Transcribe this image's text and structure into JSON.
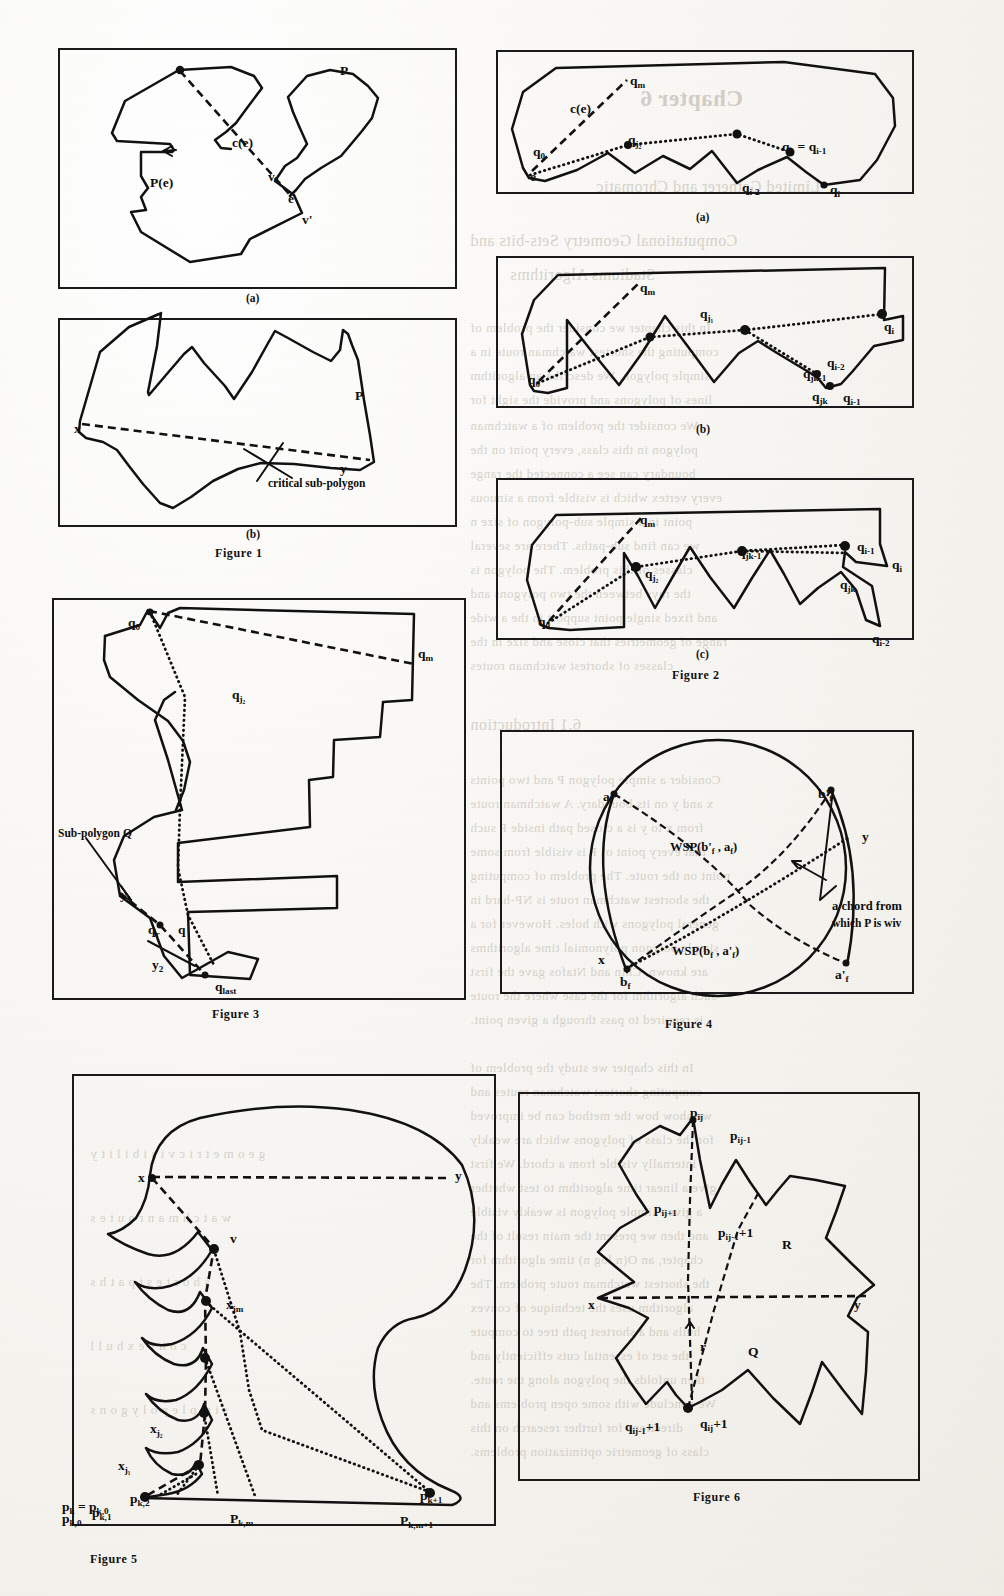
{
  "page": {
    "width": 1004,
    "height": 1596,
    "background_color": "#f3f1ec",
    "ink_color": "#111111",
    "ghost_color": "#b9b3a8"
  },
  "ghost_text": [
    {
      "text": "Chapter 6",
      "x": 640,
      "y": 86,
      "size": "big"
    },
    {
      "text": "Limited Gatherer and Chromatic",
      "x": 596,
      "y": 178,
      "size": "mid"
    },
    {
      "text": "Computational Geometry Sets-bits and",
      "x": 470,
      "y": 232,
      "size": "mid"
    },
    {
      "text": "Stadiums Algorithms",
      "x": 510,
      "y": 266,
      "size": "mid"
    },
    {
      "text": "In this chapter we consider the problem of",
      "x": 470,
      "y": 320,
      "size": "sm"
    },
    {
      "text": "computing the shortest watchman route in a",
      "x": 470,
      "y": 344,
      "size": "sm"
    },
    {
      "text": "simple polygon. We describe an algorithm",
      "x": 470,
      "y": 368,
      "size": "sm"
    },
    {
      "text": "lines of polygons and provide the sight for",
      "x": 470,
      "y": 392,
      "size": "sm"
    },
    {
      "text": "We consider the problem of a watchman",
      "x": 470,
      "y": 418,
      "size": "sm"
    },
    {
      "text": "polygon in this class, every point on the",
      "x": 470,
      "y": 442,
      "size": "sm"
    },
    {
      "text": "boundary can see a connected the range",
      "x": 470,
      "y": 466,
      "size": "sm"
    },
    {
      "text": "every vertex which is visible from a sinuous",
      "x": 470,
      "y": 490,
      "size": "sm"
    },
    {
      "text": "point in a simple sub-polygon of size n",
      "x": 470,
      "y": 514,
      "size": "sm"
    },
    {
      "text": "we can find sub-paths. There are several",
      "x": 470,
      "y": 538,
      "size": "sm"
    },
    {
      "text": "classes of this problem. The polygon is",
      "x": 470,
      "y": 562,
      "size": "sm"
    },
    {
      "text": "the rays between the two polygons and",
      "x": 470,
      "y": 586,
      "size": "sm"
    },
    {
      "text": "and fixed single point support in the a wide",
      "x": 470,
      "y": 610,
      "size": "sm"
    },
    {
      "text": "range of geometries that close and size in the",
      "x": 470,
      "y": 634,
      "size": "sm"
    },
    {
      "text": "classes of shortest watchman routes",
      "x": 470,
      "y": 658,
      "size": "sm"
    },
    {
      "text": "6.1 Introduction",
      "x": 470,
      "y": 716,
      "size": "mid"
    },
    {
      "text": "Consider a simple polygon P and two points",
      "x": 470,
      "y": 772,
      "size": "sm"
    },
    {
      "text": "x and y on its boundary. A watchman route",
      "x": 470,
      "y": 796,
      "size": "sm"
    },
    {
      "text": "from x to y is a closed path inside P such",
      "x": 470,
      "y": 820,
      "size": "sm"
    },
    {
      "text": "that every point of P is visible from some",
      "x": 470,
      "y": 844,
      "size": "sm"
    },
    {
      "text": "point on the route. The problem of computing",
      "x": 470,
      "y": 868,
      "size": "sm"
    },
    {
      "text": "the shortest watchman route is NP-hard in",
      "x": 470,
      "y": 892,
      "size": "sm"
    },
    {
      "text": "general polygons with holes. However for a",
      "x": 470,
      "y": 916,
      "size": "sm"
    },
    {
      "text": "simple polygon polynomial time algorithms",
      "x": 470,
      "y": 940,
      "size": "sm"
    },
    {
      "text": "are known. Chin and Ntafos gave the first",
      "x": 470,
      "y": 964,
      "size": "sm"
    },
    {
      "text": "such algorithm for the case where the route",
      "x": 470,
      "y": 988,
      "size": "sm"
    },
    {
      "text": "is required to pass through a given point.",
      "x": 470,
      "y": 1012,
      "size": "sm"
    },
    {
      "text": "In this chapter we study the problem of",
      "x": 470,
      "y": 1060,
      "size": "sm"
    },
    {
      "text": "computing shortest watchman routes and",
      "x": 470,
      "y": 1084,
      "size": "sm"
    },
    {
      "text": "we show how the method can be improved",
      "x": 470,
      "y": 1108,
      "size": "sm"
    },
    {
      "text": "for the class of polygons which are weakly",
      "x": 470,
      "y": 1132,
      "size": "sm"
    },
    {
      "text": "internally visible from a chord. We first",
      "x": 470,
      "y": 1156,
      "size": "sm"
    },
    {
      "text": "give a linear time algorithm to test whether",
      "x": 470,
      "y": 1180,
      "size": "sm"
    },
    {
      "text": "a given simple polygon is weakly visible",
      "x": 470,
      "y": 1204,
      "size": "sm"
    },
    {
      "text": "and then we present the main result of the",
      "x": 470,
      "y": 1228,
      "size": "sm"
    },
    {
      "text": "chapter, an O(n log n) time algorithm for",
      "x": 470,
      "y": 1252,
      "size": "sm"
    },
    {
      "text": "the shortest watchman route problem. The",
      "x": 470,
      "y": 1276,
      "size": "sm"
    },
    {
      "text": "algorithm uses the technique of convex",
      "x": 470,
      "y": 1300,
      "size": "sm"
    },
    {
      "text": "hulls and a shortest path tree to compute",
      "x": 470,
      "y": 1324,
      "size": "sm"
    },
    {
      "text": "the set of essential cuts efficiently and",
      "x": 470,
      "y": 1348,
      "size": "sm"
    },
    {
      "text": "then unfolds the polygon along the route.",
      "x": 470,
      "y": 1372,
      "size": "sm"
    },
    {
      "text": "We conclude with some open problems and",
      "x": 470,
      "y": 1396,
      "size": "sm"
    },
    {
      "text": "directions for further research on this",
      "x": 470,
      "y": 1420,
      "size": "sm"
    },
    {
      "text": "class of geometric optimization problems.",
      "x": 470,
      "y": 1444,
      "size": "sm"
    },
    {
      "text": "g e o m e t r i c   v i s i b i l i t y",
      "x": 90,
      "y": 1146,
      "size": "sm"
    },
    {
      "text": "w a t c h m a n   r o u t e s",
      "x": 90,
      "y": 1210,
      "size": "sm"
    },
    {
      "text": "s h o r t e s t   p a t h s",
      "x": 90,
      "y": 1274,
      "size": "sm"
    },
    {
      "text": "c o n v e x   h u l l",
      "x": 90,
      "y": 1338,
      "size": "sm"
    },
    {
      "text": "s i m p l e   p o l y g o n s",
      "x": 90,
      "y": 1402,
      "size": "sm"
    }
  ],
  "figures": [
    {
      "id": "figure-1",
      "caption": "Figure  1",
      "panels": [
        {
          "id": "figure-1a",
          "sublabel": "(a)",
          "labels": [
            {
              "name": "polygon-P",
              "text": "P",
              "x": 340,
              "y": 64
            },
            {
              "name": "chord-c-e",
              "text": "c(e)",
              "x": 232,
              "y": 136
            },
            {
              "name": "pocket-P-e",
              "text": "P(e)",
              "x": 150,
              "y": 176
            },
            {
              "name": "vertex-v",
              "text": "v",
              "x": 268,
              "y": 170
            },
            {
              "name": "edge-e",
              "text": "e",
              "x": 288,
              "y": 192
            },
            {
              "name": "vertex-v-prime",
              "text": "v'",
              "x": 302,
              "y": 213
            }
          ]
        },
        {
          "id": "figure-1b",
          "sublabel": "(b)",
          "labels": [
            {
              "name": "polygon-P",
              "text": "P",
              "x": 355,
              "y": 389
            },
            {
              "name": "point-x",
              "text": "x",
              "x": 74,
              "y": 422
            },
            {
              "name": "point-y",
              "text": "y",
              "x": 340,
              "y": 462
            },
            {
              "name": "critical-sub-polygon",
              "text": "critical sub-polygon",
              "x": 268,
              "y": 478
            }
          ]
        }
      ]
    },
    {
      "id": "figure-2",
      "caption": "Figure 2",
      "panels": [
        {
          "id": "figure-2a",
          "sublabel": "(a)",
          "labels": [
            {
              "name": "vertex-qm",
              "text": "q",
              "sub": "m",
              "x": 630,
              "y": 74
            },
            {
              "name": "chord-c-e",
              "text": "c(e)",
              "x": 570,
              "y": 102
            },
            {
              "name": "vertex-q0",
              "text": "q",
              "sub": "0",
              "x": 533,
              "y": 145
            },
            {
              "name": "edge-e",
              "text": "e",
              "x": 530,
              "y": 170
            },
            {
              "name": "vertex-qj2",
              "text": "q",
              "sub": "j₂",
              "x": 628,
              "y": 133
            },
            {
              "name": "vertex-qji-eq-qi-1",
              "text": "q",
              "sub": "jᵢ",
              "x": 782,
              "y": 140,
              "extra": "= q",
              "extra_sub": "i-1"
            },
            {
              "name": "vertex-qi-2",
              "text": "q",
              "sub": "i-2",
              "x": 742,
              "y": 181
            },
            {
              "name": "vertex-qi",
              "text": "q",
              "sub": "i",
              "x": 830,
              "y": 183
            }
          ]
        },
        {
          "id": "figure-2b",
          "sublabel": "(b)",
          "labels": [
            {
              "name": "vertex-qm",
              "text": "q",
              "sub": "m",
              "x": 640,
              "y": 281
            },
            {
              "name": "vertex-qj1",
              "text": "q",
              "sub": "j₁",
              "x": 700,
              "y": 307
            },
            {
              "name": "vertex-q0",
              "text": "q",
              "sub": "0",
              "x": 528,
              "y": 373
            },
            {
              "name": "vertex-qi",
              "text": "q",
              "sub": "i",
              "x": 884,
              "y": 320
            },
            {
              "name": "vertex-qi-2",
              "text": "q",
              "sub": "i-2",
              "x": 827,
              "y": 356
            },
            {
              "name": "vertex-qjk-1",
              "text": "q",
              "sub": "jk-1",
              "x": 803,
              "y": 367
            },
            {
              "name": "vertex-qjk",
              "text": "q",
              "sub": "jk",
              "x": 812,
              "y": 390
            },
            {
              "name": "vertex-qi-1",
              "text": "q",
              "sub": "i-1",
              "x": 843,
              "y": 391
            }
          ]
        },
        {
          "id": "figure-2c",
          "sublabel": "(c)",
          "labels": [
            {
              "name": "vertex-qm",
              "text": "q",
              "sub": "m",
              "x": 640,
              "y": 513
            },
            {
              "name": "vertex-qjk-1",
              "text": "q",
              "sub": "jk-1",
              "x": 738,
              "y": 545
            },
            {
              "name": "vertex-qj2",
              "text": "q",
              "sub": "j₂",
              "x": 645,
              "y": 567
            },
            {
              "name": "vertex-q0",
              "text": "q",
              "sub": "0",
              "x": 538,
              "y": 615
            },
            {
              "name": "vertex-qi-1",
              "text": "q",
              "sub": "i-1",
              "x": 857,
              "y": 540
            },
            {
              "name": "vertex-qjk",
              "text": "q",
              "sub": "jk",
              "x": 840,
              "y": 578
            },
            {
              "name": "vertex-qi",
              "text": "q",
              "sub": "i",
              "x": 892,
              "y": 558
            },
            {
              "name": "vertex-qi-2",
              "text": "q",
              "sub": "i-2",
              "x": 872,
              "y": 632
            }
          ]
        }
      ]
    },
    {
      "id": "figure-3",
      "caption": "Figure 3",
      "labels": [
        {
          "name": "vertex-q0",
          "text": "q",
          "sub": "0",
          "x": 128,
          "y": 616
        },
        {
          "name": "vertex-qm",
          "text": "q",
          "sub": "m",
          "x": 418,
          "y": 647
        },
        {
          "name": "vertex-qj2",
          "text": "q",
          "sub": "j₂",
          "x": 232,
          "y": 688
        },
        {
          "name": "sub-polygon-Q",
          "text": "Sub-polygon Q",
          "x": 58,
          "y": 828
        },
        {
          "name": "point-y1",
          "text": "y",
          "sub": "1",
          "x": 120,
          "y": 888
        },
        {
          "name": "vertex-qr",
          "text": "q",
          "sub": "r",
          "x": 148,
          "y": 923
        },
        {
          "name": "vertex-q",
          "text": "q",
          "x": 178,
          "y": 923
        },
        {
          "name": "point-y2",
          "text": "y",
          "sub": "2",
          "x": 152,
          "y": 958
        },
        {
          "name": "vertex-qlast",
          "text": "q",
          "sub": "last",
          "x": 215,
          "y": 980
        }
      ]
    },
    {
      "id": "figure-4",
      "caption": "Figure 4",
      "labels": [
        {
          "name": "vertex-af",
          "text": "a",
          "sub": "f",
          "x": 603,
          "y": 790
        },
        {
          "name": "vertex-bf-prime",
          "text": "b'",
          "sub": "f",
          "x": 818,
          "y": 787
        },
        {
          "name": "point-y",
          "text": "y",
          "x": 862,
          "y": 830
        },
        {
          "name": "wsp-upper",
          "text": "WSP(b'",
          "sub": "f",
          "extra": ", a",
          "extra_sub": "f",
          "tail": ")",
          "x": 670,
          "y": 841
        },
        {
          "name": "wsp-lower",
          "text": "WSP(b",
          "sub": "f",
          "extra": ", a'",
          "extra_sub": "f",
          "tail": ")",
          "x": 672,
          "y": 945
        },
        {
          "name": "point-x",
          "text": "x",
          "x": 598,
          "y": 953
        },
        {
          "name": "vertex-bf",
          "text": "b",
          "sub": "f",
          "x": 620,
          "y": 975
        },
        {
          "name": "vertex-af-prime",
          "text": "a'",
          "sub": "f",
          "x": 835,
          "y": 968
        },
        {
          "name": "chord-annotation-line1",
          "text": "a chord from",
          "x": 832,
          "y": 900
        },
        {
          "name": "chord-annotation-line2",
          "text": "which P is wiv",
          "x": 832,
          "y": 918
        }
      ]
    },
    {
      "id": "figure-5",
      "caption": "Figure 5",
      "labels": [
        {
          "name": "point-x",
          "text": "x",
          "x": 138,
          "y": 1171
        },
        {
          "name": "point-y",
          "text": "y",
          "x": 455,
          "y": 1169
        },
        {
          "name": "vertex-v",
          "text": "v",
          "x": 230,
          "y": 1232
        },
        {
          "name": "vertex-xjm",
          "text": "x",
          "sub": "jm",
          "x": 226,
          "y": 1298
        },
        {
          "name": "vertex-xj2",
          "text": "x",
          "sub": "j₂",
          "x": 150,
          "y": 1422
        },
        {
          "name": "vertex-xj1",
          "text": "x",
          "sub": "j₁",
          "x": 118,
          "y": 1459
        },
        {
          "name": "vertex-pk-eq",
          "text": "p",
          "sub": "k",
          "extra": "= p",
          "extra_sub": "k,0",
          "x": 62,
          "y": 1500
        },
        {
          "name": "vertex-pk0",
          "text": "p",
          "sub": "k,0",
          "x": 62,
          "y": 1512
        },
        {
          "name": "vertex-pk1",
          "text": "p",
          "sub": "k,1",
          "x": 92,
          "y": 1506
        },
        {
          "name": "vertex-pk2",
          "text": "p",
          "sub": "k,2",
          "x": 130,
          "y": 1492
        },
        {
          "name": "vertex-pkm",
          "text": "P",
          "sub": "k,m",
          "x": 230,
          "y": 1512
        },
        {
          "name": "vertex-pk1plus",
          "text": "p",
          "sub": "k+1",
          "x": 420,
          "y": 1489
        },
        {
          "name": "vertex-pkm1",
          "text": "P",
          "sub": "k,m+1",
          "x": 400,
          "y": 1514
        }
      ]
    },
    {
      "id": "figure-6",
      "caption": "Figure 6",
      "labels": [
        {
          "name": "vertex-pij",
          "text": "p",
          "sub": "i",
          "sub2": "j",
          "x": 690,
          "y": 1106
        },
        {
          "name": "vertex-pij-minus1",
          "text": "p",
          "sub": "i",
          "sub2": "j-1",
          "x": 730,
          "y": 1129
        },
        {
          "name": "vertex-pijplus1",
          "text": "p",
          "sub": "i",
          "sub2": "j+1",
          "x": 654,
          "y": 1202
        },
        {
          "name": "vertex-pij-1plus1",
          "text": "p",
          "sub": "i",
          "sub2": "j-1",
          "tail": "+1",
          "x": 718,
          "y": 1226
        },
        {
          "name": "region-R",
          "text": "R",
          "x": 782,
          "y": 1238
        },
        {
          "name": "point-x",
          "text": "x",
          "x": 588,
          "y": 1298
        },
        {
          "name": "point-y",
          "text": "y",
          "x": 854,
          "y": 1298
        },
        {
          "name": "point-r",
          "text": "r",
          "x": 700,
          "y": 1340
        },
        {
          "name": "region-Q",
          "text": "Q",
          "x": 748,
          "y": 1345
        },
        {
          "name": "vertex-qij-1plus1",
          "text": "q",
          "sub": "i",
          "sub2": "j-1",
          "tail": "+1",
          "x": 625,
          "y": 1420
        },
        {
          "name": "vertex-qijplus1",
          "text": "q",
          "sub": "i",
          "sub2": "j",
          "tail": "+1",
          "x": 700,
          "y": 1417
        }
      ]
    }
  ]
}
